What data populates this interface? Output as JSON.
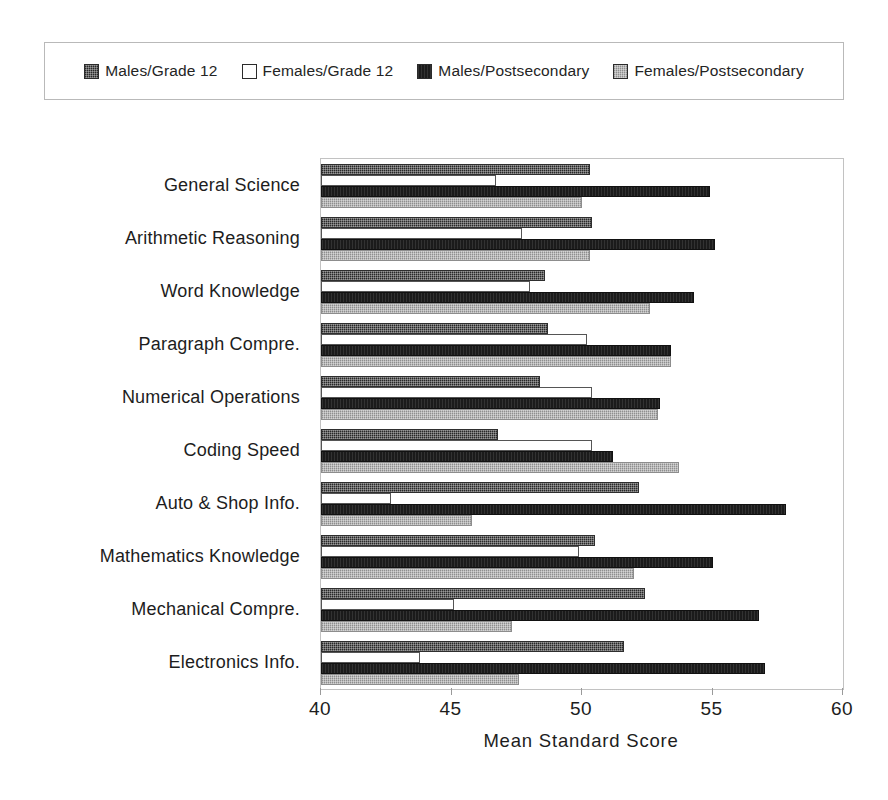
{
  "legend": {
    "position": "top",
    "entries": [
      {
        "label": "Males/Grade 12",
        "swatch": "dark-dithered-swatch",
        "color": "#4a4a4a"
      },
      {
        "label": "Females/Grade 12",
        "swatch": "white-swatch",
        "color": "#ffffff"
      },
      {
        "label": "Males/Postsecondary",
        "swatch": "black-swatch",
        "color": "#1b1b1b"
      },
      {
        "label": "Females/Postsecondary",
        "swatch": "light-gray-swatch",
        "color": "#a9a9a9"
      }
    ]
  },
  "chart_data": {
    "type": "bar",
    "orientation": "horizontal",
    "title": "",
    "xlabel": "Mean Standard Score",
    "ylabel": "",
    "xlim": [
      40,
      60
    ],
    "xticks": [
      40,
      45,
      50,
      55,
      60
    ],
    "grid": false,
    "legend_position": "top",
    "categories": [
      "General Science",
      "Arithmetic Reasoning",
      "Word Knowledge",
      "Paragraph Compre.",
      "Numerical Operations",
      "Coding Speed",
      "Auto & Shop Info.",
      "Mathematics Knowledge",
      "Mechanical Compre.",
      "Electronics Info."
    ],
    "series": [
      {
        "name": "Males/Grade 12",
        "color": "#4a4a4a",
        "values": [
          50.3,
          50.4,
          48.6,
          48.7,
          48.4,
          46.8,
          52.2,
          50.5,
          52.4,
          51.6
        ]
      },
      {
        "name": "Females/Grade 12",
        "color": "#ffffff",
        "values": [
          46.7,
          47.7,
          48.0,
          50.2,
          50.4,
          50.4,
          42.7,
          49.9,
          45.1,
          43.8
        ]
      },
      {
        "name": "Males/Postsecondary",
        "color": "#1b1b1b",
        "values": [
          54.9,
          55.1,
          54.3,
          53.4,
          53.0,
          51.2,
          57.8,
          55.0,
          56.8,
          57.0
        ]
      },
      {
        "name": "Females/Postsecondary",
        "color": "#a9a9a9",
        "values": [
          50.0,
          50.3,
          52.6,
          53.4,
          52.9,
          53.7,
          45.8,
          52.0,
          47.3,
          47.6
        ]
      }
    ]
  }
}
